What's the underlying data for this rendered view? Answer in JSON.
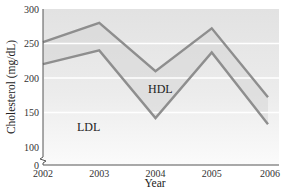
{
  "chart_data": {
    "type": "area",
    "title": "",
    "xlabel": "Year",
    "ylabel": "Cholesterol (mg/dL)",
    "categories": [
      "2002",
      "2003",
      "2004",
      "2005",
      "2006"
    ],
    "x": [
      2002,
      2003,
      2004,
      2005,
      2006
    ],
    "series": [
      {
        "name": "LDL",
        "values": [
          220,
          240,
          142,
          237,
          133
        ]
      },
      {
        "name": "LDL + HDL (total)",
        "values": [
          252,
          280,
          210,
          272,
          172
        ]
      }
    ],
    "region_labels": [
      "LDL",
      "HDL"
    ],
    "yticks": [
      0,
      100,
      150,
      200,
      250,
      300
    ],
    "ylim": [
      0,
      300
    ],
    "axis_break": true,
    "grid": "horizontal white bands",
    "legend": "none (inline region labels)",
    "colors": {
      "background_top": "#e4e4e4",
      "background_bottom": "#fafafa",
      "line": "#8e8e8e",
      "gridline": "#ffffff",
      "axis": "#555555"
    }
  },
  "labels": {
    "ldl": "LDL",
    "hdl": "HDL",
    "xlabel": "Year",
    "ylabel": "Cholesterol (mg/dL)"
  },
  "ticks": {
    "y": [
      "300",
      "250",
      "200",
      "150",
      "100",
      "0"
    ],
    "x": [
      "2002",
      "2003",
      "2004",
      "2005",
      "2006"
    ]
  }
}
